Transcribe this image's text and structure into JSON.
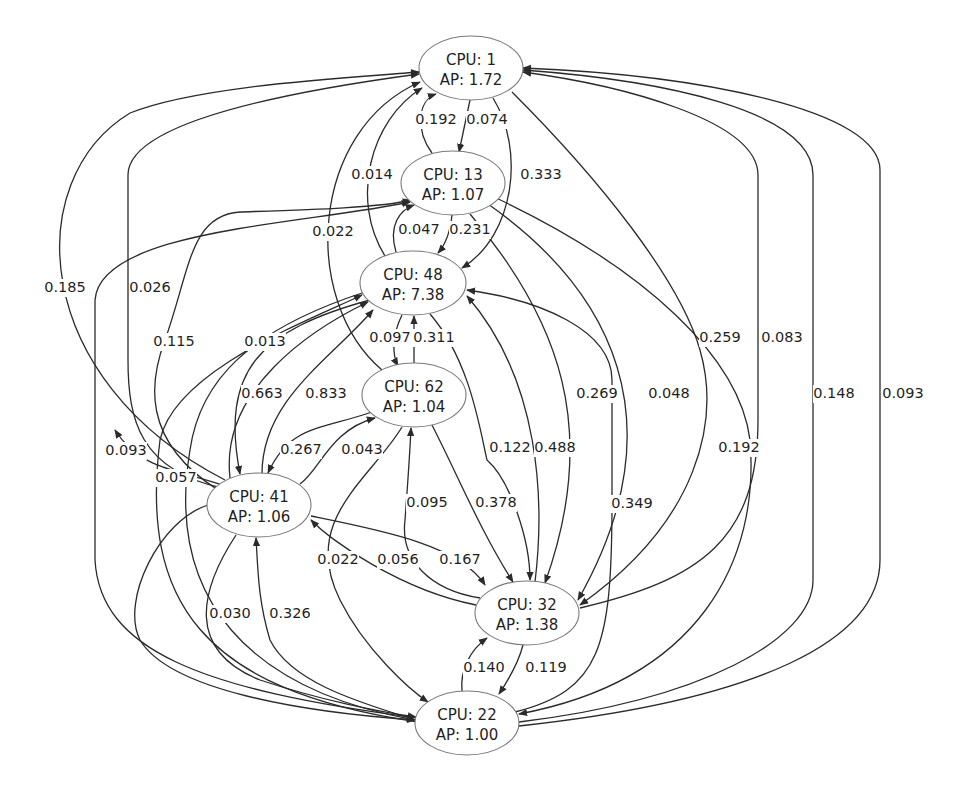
{
  "diagram": {
    "type": "directed-graph",
    "nodes": [
      {
        "id": "n1",
        "cpu_label": "CPU: 1",
        "ap_label": "AP: 1.72",
        "cx": 471,
        "cy": 68,
        "rx": 52,
        "ry": 32
      },
      {
        "id": "n13",
        "cpu_label": "CPU: 13",
        "ap_label": "AP: 1.07",
        "cx": 453,
        "cy": 183,
        "rx": 52,
        "ry": 32
      },
      {
        "id": "n48",
        "cpu_label": "CPU: 48",
        "ap_label": "AP: 7.38",
        "cx": 413,
        "cy": 283,
        "rx": 53,
        "ry": 32
      },
      {
        "id": "n62",
        "cpu_label": "CPU: 62",
        "ap_label": "AP: 1.04",
        "cx": 414,
        "cy": 395,
        "rx": 52,
        "ry": 32
      },
      {
        "id": "n41",
        "cpu_label": "CPU: 41",
        "ap_label": "AP: 1.06",
        "cx": 259,
        "cy": 505,
        "rx": 52,
        "ry": 32
      },
      {
        "id": "n32",
        "cpu_label": "CPU: 32",
        "ap_label": "AP: 1.38",
        "cx": 527,
        "cy": 613,
        "rx": 52,
        "ry": 32
      },
      {
        "id": "n22",
        "cpu_label": "CPU: 22",
        "ap_label": "AP: 1.00",
        "cx": 467,
        "cy": 723,
        "rx": 52,
        "ry": 32
      }
    ],
    "edges": [
      {
        "from": "13",
        "to": "1",
        "label": "0.192",
        "lx": 436,
        "ly": 120,
        "path": "M432,153 C415,130 418,100 436,94"
      },
      {
        "from": "1",
        "to": "13",
        "label": "0.074",
        "lx": 487,
        "ly": 120,
        "path": "M470,100 L459,152"
      },
      {
        "from": "48",
        "to": "1",
        "label": "0.014",
        "lx": 372,
        "ly": 175,
        "path": "M385,256 C350,200 370,120 422,88"
      },
      {
        "from": "1",
        "to": "48",
        "label": "0.333",
        "lx": 541,
        "ly": 175,
        "path": "M493,98 C525,150 515,235 462,268"
      },
      {
        "from": "62",
        "to": "1",
        "label": "0.022",
        "lx": 333,
        "ly": 232,
        "path": "M382,370 C300,300 310,130 420,82"
      },
      {
        "from": "48",
        "to": "13",
        "label": "0.047",
        "lx": 419,
        "ly": 230,
        "path": "M396,252 C388,225 400,210 414,205"
      },
      {
        "from": "13",
        "to": "48",
        "label": "0.231",
        "lx": 470,
        "ly": 230,
        "path": "M452,215 C450,235 445,245 438,253"
      },
      {
        "from": "41",
        "to": "1",
        "label": "0.185",
        "lx": 65,
        "ly": 288,
        "path": "M225,480 C30,380 20,180 130,113 C200,85 350,78 419,72"
      },
      {
        "from": "41",
        "to": "1",
        "label": "0.026",
        "lx": 150,
        "ly": 288,
        "path": "M222,488 C140,470 128,420 128,360 L128,175 C128,120 300,90 419,74"
      },
      {
        "from": "41",
        "to": "13",
        "label": "0.115",
        "lx": 174,
        "ly": 342,
        "path": "M218,490 C140,440 150,380 165,340 C190,270 190,215 240,212 C300,210 380,208 411,200"
      },
      {
        "from": "22",
        "to": "13",
        "label": "",
        "lx": 0,
        "ly": 0,
        "path": "M418,718 C200,690 100,650 95,560 L95,300 C100,230 300,225 410,202"
      },
      {
        "from": "41",
        "to": "48",
        "label": "0.013",
        "lx": 265,
        "ly": 342,
        "path": "M230,478 C220,390 310,330 368,302"
      },
      {
        "from": "22",
        "to": "48",
        "label": "0.057",
        "lx": 176,
        "ly": 478,
        "path": "M418,722 C200,690 140,600 160,440 C175,370 310,320 362,295"
      },
      {
        "from": "48",
        "to": "41",
        "label": "0.663",
        "lx": 262,
        "ly": 394,
        "path": "M370,300 C260,330 220,370 240,474"
      },
      {
        "from": "41",
        "to": "48",
        "label": "0.833",
        "lx": 326,
        "ly": 394,
        "path": "M262,474 C262,400 330,360 373,310"
      },
      {
        "from": "62",
        "to": "48",
        "label": "0.311",
        "lx": 434,
        "ly": 338,
        "path": "M414,363 L414,316"
      },
      {
        "from": "48",
        "to": "62",
        "label": "0.097",
        "lx": 390,
        "ly": 338,
        "path": "M402,315 C392,335 392,355 398,366"
      },
      {
        "from": "62",
        "to": "41",
        "label": "0.267",
        "lx": 301,
        "ly": 450,
        "path": "M372,412 C320,430 290,425 268,473"
      },
      {
        "from": "41",
        "to": "62",
        "label": "0.043",
        "lx": 362,
        "ly": 450,
        "path": "M300,484 C320,470 330,430 375,418"
      },
      {
        "from": "62",
        "to": "22",
        "label": "0.022",
        "lx": 338,
        "ly": 560,
        "path": "M402,427 C370,480 300,520 340,600 C365,650 410,690 428,702"
      },
      {
        "from": "32",
        "to": "41",
        "label": "0.056",
        "lx": 398,
        "ly": 560,
        "path": "M476,605 C400,590 330,540 311,520"
      },
      {
        "from": "41",
        "to": "32",
        "label": "0.167",
        "lx": 460,
        "ly": 560,
        "path": "M311,516 C380,530 460,545 485,585"
      },
      {
        "from": "32",
        "to": "62",
        "label": "0.095",
        "lx": 427,
        "ly": 503,
        "path": "M480,598 C430,590 400,560 405,520 C408,480 410,450 411,428"
      },
      {
        "from": "62",
        "to": "32",
        "label": "0.378",
        "lx": 496,
        "ly": 503,
        "path": "M432,425 C460,480 480,530 513,582"
      },
      {
        "from": "48",
        "to": "32",
        "label": "0.122",
        "lx": 510,
        "ly": 448,
        "path": "M430,314 C470,360 480,430 487,460 C510,480 530,540 530,580"
      },
      {
        "from": "32",
        "to": "48",
        "label": "0.488",
        "lx": 555,
        "ly": 448,
        "path": "M535,582 C545,500 540,380 467,296"
      },
      {
        "from": "13",
        "to": "32",
        "label": "0.269",
        "lx": 597,
        "ly": 394,
        "path": "M470,214 C560,320 600,430 545,583"
      },
      {
        "from": "22",
        "to": "48",
        "label": "0.349",
        "lx": 632,
        "ly": 504,
        "path": "M515,712 C600,690 612,650 612,500 L612,380 C612,330 540,300 467,290"
      },
      {
        "from": "13",
        "to": "32",
        "label": "0.048",
        "lx": 669,
        "ly": 394,
        "path": "M488,204 C610,290 680,420 578,600"
      },
      {
        "from": "1",
        "to": "32",
        "label": "0.259",
        "lx": 720,
        "ly": 338,
        "path": "M512,92 C600,180 680,280 700,350 C720,420 700,520 580,605"
      },
      {
        "from": "13",
        "to": "22",
        "label": "0.192",
        "lx": 739,
        "ly": 448,
        "path": "M492,196 C650,270 740,360 750,440 C760,560 700,680 519,714"
      },
      {
        "from": "32",
        "to": "1",
        "label": "0.083",
        "lx": 782,
        "ly": 338,
        "path": "M580,608 C700,580 758,540 758,420 L758,175 C758,120 620,85 523,72"
      },
      {
        "from": "22",
        "to": "1",
        "label": "0.148",
        "lx": 834,
        "ly": 394,
        "path": "M519,722 C700,700 813,640 813,580 L813,175 C813,110 660,80 523,70"
      },
      {
        "from": "22",
        "to": "1",
        "label": "0.093",
        "lx": 903,
        "ly": 394,
        "path": "M519,726 C760,700 880,640 880,560 L880,170 C880,110 700,75 523,68"
      },
      {
        "from": "41",
        "to": "22",
        "label": "0.030",
        "lx": 230,
        "ly": 614,
        "path": "M236,535 C200,590 185,650 260,680 C320,700 380,712 416,717"
      },
      {
        "from": "22",
        "to": "41",
        "label": "0.326",
        "lx": 290,
        "ly": 614,
        "path": "M416,720 C350,700 290,680 270,640 C258,600 258,570 256,538"
      },
      {
        "from": "48",
        "to": "22",
        "label": "",
        "lx": 0,
        "ly": 0,
        "path": "M362,293 C250,330 200,380 190,450 C165,600 250,690 415,720"
      },
      {
        "from": "41",
        "to": "22",
        "label": "",
        "lx": 0,
        "ly": 0,
        "path": "M208,505 C160,520 120,600 140,640 C170,690 300,712 415,720"
      },
      {
        "from": "22",
        "to": "32",
        "label": "0.140",
        "lx": 484,
        "ly": 668,
        "path": "M462,691 C460,670 470,650 487,638"
      },
      {
        "from": "32",
        "to": "22",
        "label": "0.119",
        "lx": 546,
        "ly": 668,
        "path": "M523,645 C518,665 505,685 499,694"
      },
      {
        "from": "41",
        "to": "22",
        "label": "0.093",
        "lx": 126,
        "ly": 451,
        "path": "M225,486 C180,470 140,470 115,430"
      }
    ]
  }
}
